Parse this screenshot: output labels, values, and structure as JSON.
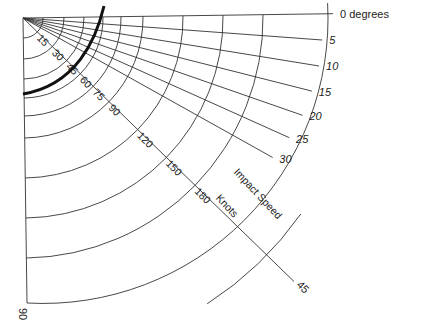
{
  "diagram": {
    "title": "",
    "origin": [
      23,
      18
    ],
    "angle_axis": {
      "label_suffix": " degrees",
      "angles": [
        {
          "deg": 0,
          "label": "0 degrees"
        },
        {
          "deg": 5,
          "label": "5"
        },
        {
          "deg": 10,
          "label": "10"
        },
        {
          "deg": 15,
          "label": "15"
        },
        {
          "deg": 20,
          "label": "20"
        },
        {
          "deg": 25,
          "label": "25"
        },
        {
          "deg": 30,
          "label": "30"
        },
        {
          "deg": 45,
          "label": "45"
        },
        {
          "deg": 90,
          "label": "90"
        }
      ]
    },
    "speed_axis": {
      "title_line1": "Impact Speed",
      "title_line2": "Knots",
      "ticks": [
        {
          "value": 15,
          "label": "15",
          "r": 20
        },
        {
          "value": 30,
          "label": "30",
          "r": 41
        },
        {
          "value": 45,
          "label": "45",
          "r": 61
        },
        {
          "value": 60,
          "label": "60",
          "r": 80
        },
        {
          "value": 75,
          "label": "75",
          "r": 98
        },
        {
          "value": 90,
          "label": "90",
          "r": 120
        },
        {
          "value": 120,
          "label": "120",
          "r": 160
        },
        {
          "value": 150,
          "label": "150",
          "r": 200
        },
        {
          "value": 180,
          "label": "180",
          "r": 240
        }
      ],
      "outer_r": 285
    },
    "bold_curve": {
      "description": "thick boundary curve",
      "color": "#111111"
    }
  },
  "chart_data": {
    "type": "polar-nomogram",
    "title": "",
    "radial_label": "Impact Speed Knots",
    "radial_ticks": [
      15,
      30,
      45,
      60,
      75,
      90,
      120,
      150,
      180
    ],
    "angular_ticks_deg": [
      0,
      5,
      10,
      15,
      20,
      25,
      30,
      45,
      90
    ],
    "angular_label": "degrees"
  }
}
